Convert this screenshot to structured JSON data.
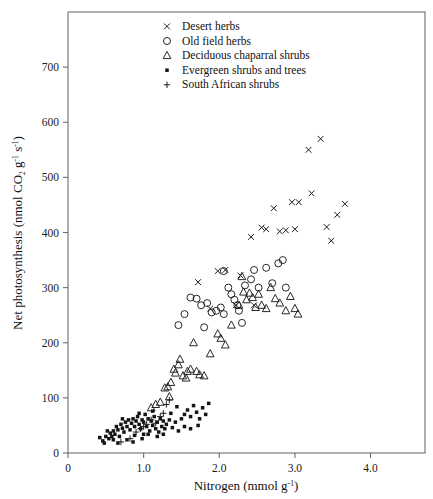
{
  "figure": {
    "background": "#ffffff",
    "frame_color": "#6e6e6e",
    "marker_color": "#1c1c1c"
  },
  "axis": {
    "x_title_main": "Nitrogen (mmol g",
    "x_title_sup": "-1",
    "x_title_close": ")",
    "y_title_part1": "Net photosynthesis (nmol CO",
    "y_title_sub": "2",
    "y_title_part2": " g",
    "y_title_sup1": "-1",
    "y_title_part3": " s",
    "y_title_sup2": "-1",
    "y_title_close": ")",
    "x_ticks": [
      "0",
      "1.0",
      "2.0",
      "3.0",
      "4.0"
    ],
    "x_tick_values": [
      0,
      1.0,
      2.0,
      3.0,
      4.0
    ],
    "y_ticks": [
      "0",
      "100",
      "200",
      "300",
      "400",
      "500",
      "600",
      "700"
    ],
    "y_tick_values": [
      0,
      100,
      200,
      300,
      400,
      500,
      600,
      700
    ]
  },
  "legend": {
    "position": "top-left-inside",
    "entries": [
      {
        "marker": "cross-x",
        "label": "Desert herbs"
      },
      {
        "marker": "open-circle",
        "label": "Old field herbs"
      },
      {
        "marker": "open-triangle",
        "label": "Deciduous chaparral shrubs"
      },
      {
        "marker": "filled-square-dot",
        "label": "Evergreen shrubs and trees"
      },
      {
        "marker": "plus",
        "label": "South African shrubs"
      }
    ]
  },
  "chart_data": {
    "type": "scatter",
    "title": "",
    "xlabel": "Nitrogen (mmol g-1)",
    "ylabel": "Net photosynthesis (nmol CO2 g-1 s-1)",
    "xlim": [
      0,
      4.72
    ],
    "ylim": [
      0,
      800
    ],
    "grid": false,
    "legend_position": "upper left inside plot",
    "series": [
      {
        "name": "Desert herbs",
        "marker": "cross-x",
        "points": [
          [
            1.98,
            330
          ],
          [
            2.08,
            332
          ],
          [
            2.28,
            322
          ],
          [
            2.42,
            392
          ],
          [
            2.56,
            409
          ],
          [
            2.62,
            406
          ],
          [
            2.72,
            444
          ],
          [
            2.8,
            402
          ],
          [
            2.88,
            404
          ],
          [
            2.96,
            455
          ],
          [
            3.0,
            406
          ],
          [
            3.05,
            455
          ],
          [
            3.18,
            550
          ],
          [
            3.34,
            570
          ],
          [
            3.22,
            471
          ],
          [
            3.42,
            410
          ],
          [
            3.48,
            385
          ],
          [
            3.56,
            432
          ],
          [
            3.66,
            452
          ],
          [
            1.72,
            310
          ],
          [
            1.88,
            262
          ],
          [
            2.22,
            268
          ],
          [
            2.46,
            268
          ]
        ]
      },
      {
        "name": "Old field herbs",
        "marker": "open-circle",
        "points": [
          [
            1.62,
            282
          ],
          [
            1.7,
            280
          ],
          [
            1.76,
            268
          ],
          [
            1.84,
            272
          ],
          [
            1.9,
            255
          ],
          [
            1.96,
            258
          ],
          [
            2.02,
            264
          ],
          [
            2.06,
            252
          ],
          [
            2.12,
            300
          ],
          [
            2.16,
            288
          ],
          [
            2.2,
            278
          ],
          [
            2.24,
            268
          ],
          [
            2.26,
            258
          ],
          [
            2.34,
            304
          ],
          [
            2.42,
            315
          ],
          [
            2.46,
            332
          ],
          [
            2.52,
            300
          ],
          [
            2.62,
            336
          ],
          [
            2.7,
            308
          ],
          [
            2.78,
            344
          ],
          [
            2.84,
            350
          ],
          [
            2.88,
            300
          ],
          [
            1.54,
            252
          ],
          [
            1.46,
            232
          ],
          [
            2.06,
            330
          ],
          [
            2.3,
            236
          ],
          [
            1.8,
            228
          ]
        ]
      },
      {
        "name": "Deciduous chaparral shrubs",
        "marker": "open-triangle",
        "points": [
          [
            1.32,
            120
          ],
          [
            1.34,
            102
          ],
          [
            1.4,
            152
          ],
          [
            1.42,
            145
          ],
          [
            1.46,
            160
          ],
          [
            1.48,
            170
          ],
          [
            1.52,
            140
          ],
          [
            1.56,
            136
          ],
          [
            1.58,
            148
          ],
          [
            1.62,
            152
          ],
          [
            1.66,
            200
          ],
          [
            1.7,
            148
          ],
          [
            1.74,
            142
          ],
          [
            1.8,
            140
          ],
          [
            1.88,
            180
          ],
          [
            1.98,
            216
          ],
          [
            2.02,
            208
          ],
          [
            2.08,
            196
          ],
          [
            2.16,
            232
          ],
          [
            2.26,
            268
          ],
          [
            2.32,
            292
          ],
          [
            2.36,
            278
          ],
          [
            2.4,
            290
          ],
          [
            2.44,
            282
          ],
          [
            2.48,
            264
          ],
          [
            2.52,
            288
          ],
          [
            2.56,
            268
          ],
          [
            2.62,
            262
          ],
          [
            2.68,
            300
          ],
          [
            2.74,
            280
          ],
          [
            2.8,
            272
          ],
          [
            2.88,
            258
          ],
          [
            2.94,
            284
          ],
          [
            3.0,
            262
          ],
          [
            3.04,
            252
          ],
          [
            2.3,
            320
          ],
          [
            1.22,
            92
          ],
          [
            1.16,
            88
          ],
          [
            1.1,
            82
          ],
          [
            1.28,
            118
          ],
          [
            1.36,
            128
          ]
        ]
      },
      {
        "name": "Evergreen shrubs and trees",
        "marker": "filled-square-dot",
        "points": [
          [
            0.42,
            28
          ],
          [
            0.46,
            22
          ],
          [
            0.5,
            30
          ],
          [
            0.54,
            26
          ],
          [
            0.56,
            36
          ],
          [
            0.58,
            30
          ],
          [
            0.6,
            40
          ],
          [
            0.62,
            34
          ],
          [
            0.64,
            48
          ],
          [
            0.66,
            42
          ],
          [
            0.68,
            30
          ],
          [
            0.7,
            52
          ],
          [
            0.72,
            45
          ],
          [
            0.74,
            38
          ],
          [
            0.76,
            56
          ],
          [
            0.78,
            48
          ],
          [
            0.8,
            60
          ],
          [
            0.82,
            42
          ],
          [
            0.84,
            54
          ],
          [
            0.86,
            62
          ],
          [
            0.88,
            48
          ],
          [
            0.9,
            58
          ],
          [
            0.92,
            66
          ],
          [
            0.94,
            52
          ],
          [
            0.96,
            44
          ],
          [
            0.98,
            60
          ],
          [
            1.0,
            56
          ],
          [
            1.02,
            70
          ],
          [
            1.04,
            48
          ],
          [
            1.06,
            62
          ],
          [
            1.08,
            40
          ],
          [
            1.1,
            58
          ],
          [
            1.12,
            50
          ],
          [
            1.14,
            66
          ],
          [
            1.16,
            44
          ],
          [
            1.18,
            56
          ],
          [
            1.2,
            38
          ],
          [
            1.22,
            62
          ],
          [
            1.24,
            48
          ],
          [
            1.26,
            58
          ],
          [
            1.28,
            44
          ],
          [
            1.3,
            52
          ],
          [
            1.34,
            60
          ],
          [
            1.38,
            46
          ],
          [
            1.42,
            56
          ],
          [
            1.46,
            40
          ],
          [
            1.5,
            62
          ],
          [
            1.54,
            70
          ],
          [
            1.58,
            78
          ],
          [
            1.62,
            66
          ],
          [
            1.66,
            86
          ],
          [
            1.7,
            74
          ],
          [
            1.74,
            62
          ],
          [
            1.78,
            82
          ],
          [
            1.82,
            70
          ],
          [
            1.86,
            90
          ],
          [
            0.48,
            18
          ],
          [
            0.52,
            40
          ],
          [
            0.88,
            32
          ],
          [
            1.06,
            34
          ],
          [
            0.78,
            24
          ],
          [
            0.94,
            72
          ],
          [
            1.12,
            76
          ],
          [
            0.86,
            20
          ],
          [
            1.36,
            72
          ],
          [
            1.44,
            84
          ],
          [
            0.66,
            18
          ],
          [
            0.72,
            62
          ],
          [
            1.0,
            34
          ],
          [
            1.18,
            30
          ],
          [
            0.6,
            24
          ],
          [
            1.54,
            48
          ],
          [
            1.62,
            44
          ],
          [
            1.72,
            50
          ],
          [
            0.98,
            26
          ],
          [
            1.26,
            34
          ]
        ]
      },
      {
        "name": "South African shrubs",
        "marker": "plus",
        "points": [
          [
            0.7,
            20
          ],
          [
            0.82,
            26
          ],
          [
            0.96,
            44
          ],
          [
            1.04,
            52
          ],
          [
            1.1,
            60
          ],
          [
            1.16,
            54
          ],
          [
            1.22,
            66
          ],
          [
            1.3,
            88
          ],
          [
            1.34,
            96
          ],
          [
            0.9,
            38
          ],
          [
            1.0,
            48
          ],
          [
            1.26,
            72
          ]
        ]
      }
    ]
  }
}
